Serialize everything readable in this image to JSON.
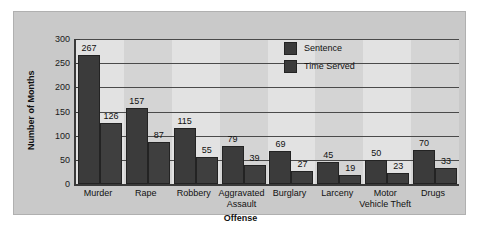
{
  "chart_data": {
    "type": "bar",
    "title": "",
    "xlabel": "Offense",
    "ylabel": "Number of Months",
    "categories": [
      "Murder",
      "Rape",
      "Robbery",
      "Aggravated Assault",
      "Burglary",
      "Larceny",
      "Motor Vehicle Theft",
      "Drugs"
    ],
    "series": [
      {
        "name": "Sentence",
        "values": [
          267,
          157,
          115,
          79,
          69,
          45,
          50,
          70
        ],
        "color": "#3b3b3b"
      },
      {
        "name": "Time Served",
        "values": [
          126,
          87,
          55,
          39,
          27,
          19,
          23,
          33
        ],
        "color": "#3f3f3f"
      }
    ],
    "ylim": [
      0,
      300
    ],
    "yticks": [
      0,
      50,
      100,
      150,
      200,
      250,
      300
    ],
    "ytick_labels": [
      "0",
      "50",
      "100",
      "150",
      "200",
      "250",
      "300"
    ],
    "grid": true,
    "legend_position": "upper-center",
    "data_labels": true
  },
  "legend": {
    "items": [
      {
        "label": "Sentence"
      },
      {
        "label": "Time Served"
      }
    ]
  },
  "colors": {
    "bar": "#3b3b3b",
    "panel": "#c9c9c9",
    "plot_background": "#e2e2e2",
    "band": "#d4d4d4",
    "gridline": "#4a4a4a",
    "axis": "#3a3a3a",
    "text": "#111111"
  }
}
